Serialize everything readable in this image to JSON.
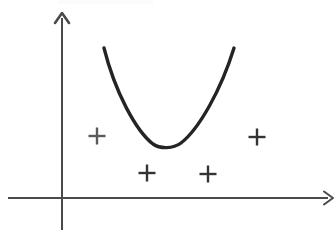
{
  "figure": {
    "kind": "hand-drawn-math-diagram",
    "background_color": "#ffffff",
    "width": 335,
    "height": 237
  },
  "axes": {
    "origin": {
      "x": 62,
      "y": 198
    },
    "x_axis": {
      "name": "x-axis",
      "start_x": 8,
      "end_x": 328,
      "y": 198,
      "color": "#4a4a4a",
      "thickness": 2.0,
      "arrow": {
        "tip_x": 333,
        "tip_y": 198,
        "size": 9
      }
    },
    "y_axis": {
      "name": "y-axis",
      "x": 62,
      "start_y": 230,
      "end_y": 18,
      "color": "#4a4a4a",
      "thickness": 2.0,
      "arrow": {
        "tip_x": 62,
        "tip_y": 13,
        "size": 10
      }
    }
  },
  "chart_data": {
    "type": "scatter",
    "title": "",
    "subtitle": "",
    "xlabel": "",
    "ylabel": "",
    "grid": false,
    "legend": "none",
    "xlim": [
      0,
      335
    ],
    "ylim": [
      0,
      237
    ],
    "curve": {
      "name": "parabola",
      "type": "quadratic",
      "color": "#242424",
      "thickness": 3.4,
      "vertex": {
        "x": 166,
        "y": 147
      },
      "left_end": {
        "x": 104,
        "y": 48
      },
      "right_end": {
        "x": 234,
        "y": 48
      },
      "path": "M 104 48 C 115 92, 136 131, 153 144 C 160 149, 173 149, 181 143 C 199 129, 221 90, 234 48"
    },
    "markers": [
      {
        "name": "marker-left",
        "symbol": "plus",
        "cx": 97,
        "cy": 136,
        "size": 17,
        "color": "#5a5a5a",
        "thickness": 2.4
      },
      {
        "name": "marker-bottom-left",
        "symbol": "plus",
        "cx": 147,
        "cy": 173,
        "size": 17,
        "color": "#333333",
        "thickness": 2.4
      },
      {
        "name": "marker-bottom-right",
        "symbol": "plus",
        "cx": 208,
        "cy": 174,
        "size": 17,
        "color": "#333333",
        "thickness": 2.4
      },
      {
        "name": "marker-right",
        "symbol": "plus",
        "cx": 257,
        "cy": 137,
        "size": 17,
        "color": "#333333",
        "thickness": 2.4
      }
    ]
  },
  "artifacts": {
    "top_smudge": {
      "name": "scan-smudge",
      "x": 58,
      "y": 0,
      "width": 95,
      "height": 4,
      "color": "#fafafb"
    }
  }
}
